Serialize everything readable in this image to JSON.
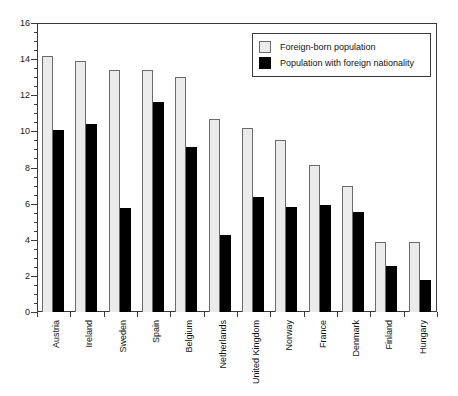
{
  "chart_data": {
    "type": "bar",
    "title": "",
    "subtitle": "",
    "xlabel": "",
    "ylabel": "",
    "ylim": [
      0,
      16
    ],
    "ytick_step": 2,
    "yminor_step": 0.5,
    "grid": false,
    "legend_position": "top-right-inside",
    "categories": [
      "Austria",
      "Ireland",
      "Sweden",
      "Spain",
      "Belgium",
      "Netherlands",
      "United Kingdom",
      "Norway",
      "France",
      "Denmark",
      "Finland",
      "Hungary"
    ],
    "ytick_labels": [
      "0",
      "2",
      "4",
      "6",
      "8",
      "10",
      "12",
      "14",
      "16"
    ],
    "ytick_values": [
      0,
      2,
      4,
      6,
      8,
      10,
      12,
      14,
      16
    ],
    "series": [
      {
        "name": "Foreign-born population",
        "color": "#ebebeb",
        "edge_color": "#6b6b6b",
        "values": [
          14.2,
          13.9,
          13.4,
          13.4,
          13.0,
          10.7,
          10.2,
          9.55,
          8.15,
          6.95,
          3.85,
          3.85
        ]
      },
      {
        "name": "Population with foreign nationality",
        "color": "#000000",
        "edge_color": "#000000",
        "values": [
          10.1,
          10.4,
          5.75,
          11.6,
          9.15,
          4.25,
          6.35,
          5.8,
          5.95,
          5.55,
          2.55,
          1.75
        ]
      }
    ]
  },
  "legend": {
    "entries": [
      {
        "label": "Foreign-born population",
        "swatch": "light"
      },
      {
        "label": "Population with foreign nationality",
        "swatch": "dark"
      }
    ]
  }
}
